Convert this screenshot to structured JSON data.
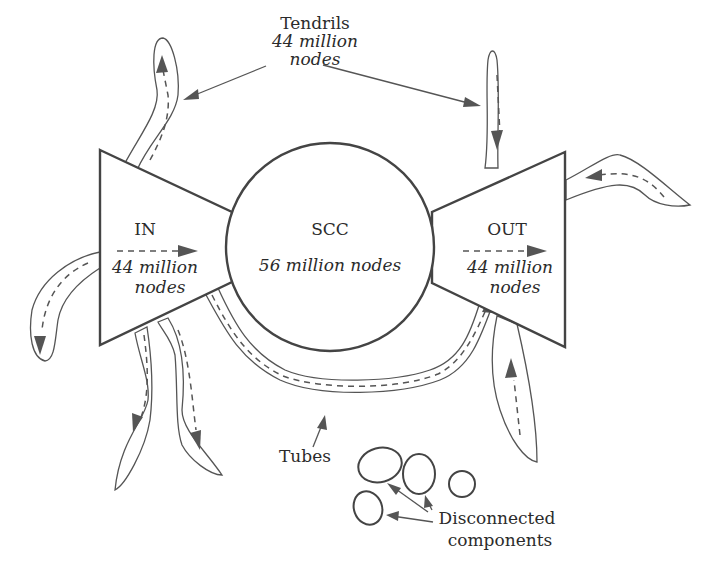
{
  "diagram": {
    "tendrils": {
      "label": "Tendrils",
      "count_line1": "44 million",
      "count_line2": "nodes"
    },
    "in_component": {
      "label": "IN",
      "count_line1": "44 million",
      "count_line2": "nodes"
    },
    "scc": {
      "label": "SCC",
      "count": "56 million nodes"
    },
    "out_component": {
      "label": "OUT",
      "count_line1": "44 million",
      "count_line2": "nodes"
    },
    "tubes": {
      "label": "Tubes"
    },
    "disconnected": {
      "label_line1": "Disconnected",
      "label_line2": "components",
      "count_shown": 5
    },
    "colors": {
      "stroke": "#444444",
      "arrow": "#555555",
      "text": "#2b2b2b",
      "background": "#ffffff"
    }
  }
}
